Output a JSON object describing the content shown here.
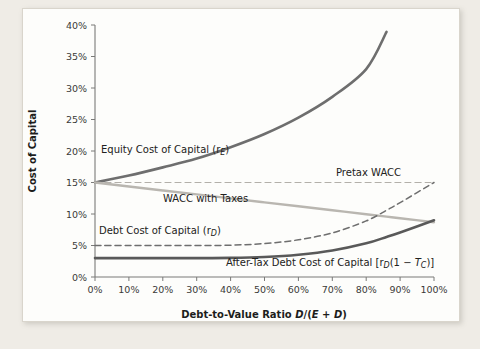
{
  "chart_data": {
    "type": "line",
    "title": "",
    "xlabel": "Debt-to-Value Ratio D/(E + D)",
    "ylabel": "Cost of Capital",
    "xlim": [
      0,
      100
    ],
    "ylim": [
      0,
      40
    ],
    "grid": false,
    "legend_position": "inline-annotations",
    "x_tick_labels": [
      "0%",
      "10%",
      "20%",
      "30%",
      "40%",
      "50%",
      "60%",
      "70%",
      "80%",
      "90%",
      "100%"
    ],
    "x_ticks": [
      0,
      10,
      20,
      30,
      40,
      50,
      60,
      70,
      80,
      90,
      100
    ],
    "y_tick_labels": [
      "0%",
      "5%",
      "10%",
      "15%",
      "20%",
      "25%",
      "30%",
      "35%",
      "40%"
    ],
    "y_ticks": [
      0,
      5,
      10,
      15,
      20,
      25,
      30,
      35,
      40
    ],
    "x": [
      0,
      10,
      20,
      30,
      40,
      50,
      60,
      70,
      80,
      86,
      90,
      100
    ],
    "series": [
      {
        "name": "Equity Cost of Capital (rE)",
        "label": "Equity Cost of Capital (r",
        "label_sub": "E",
        "label_tail": ")",
        "style": "solid",
        "color": "#6e6e6e",
        "width": 2.6,
        "values": [
          15.0,
          16.1,
          17.4,
          18.8,
          20.6,
          22.7,
          25.3,
          28.6,
          33.0,
          38.9,
          null,
          null
        ],
        "x_end": 86,
        "y_end": 38.9
      },
      {
        "name": "Pretax WACC",
        "label": "Pretax WACC",
        "style": "dashed",
        "color": "#b3b0aa",
        "width": 1.2,
        "values": [
          15.0,
          15.0,
          15.0,
          15.0,
          15.0,
          15.0,
          15.0,
          15.0,
          15.0,
          15.0,
          15.0,
          15.0
        ]
      },
      {
        "name": "WACC with Taxes",
        "label": "WACC with Taxes",
        "style": "solid",
        "color": "#b9b6b0",
        "width": 2.4,
        "values": [
          15.0,
          14.37,
          13.74,
          13.11,
          12.48,
          11.85,
          11.22,
          10.59,
          9.96,
          9.58,
          9.33,
          8.7
        ]
      },
      {
        "name": "Debt Cost of Capital (rD)",
        "label": "Debt Cost of Capital (r",
        "label_sub": "D",
        "label_tail": ")",
        "style": "dashed",
        "color": "#6e6e6e",
        "width": 1.5,
        "values": [
          5.0,
          5.0,
          5.0,
          5.0,
          5.05,
          5.3,
          5.9,
          7.0,
          8.9,
          10.6,
          11.8,
          15.0
        ]
      },
      {
        "name": "After-Tax Debt Cost of Capital [rD(1 - Tc)]",
        "label": "After-Tax Debt Cost of Capital [r",
        "label_sub": "D",
        "label_tail_pre": "(1 ",
        "label_minus": "−",
        "label_tail_var": " T",
        "label_sub2": "C",
        "label_tail_end": ")]",
        "style": "solid",
        "color": "#595959",
        "width": 2.6,
        "values": [
          3.0,
          3.0,
          3.0,
          3.0,
          3.03,
          3.18,
          3.54,
          4.2,
          5.34,
          6.36,
          7.08,
          9.0
        ]
      }
    ],
    "annotations": [
      {
        "text": "Equity Cost of Capital (rE)",
        "x": 8,
        "y": 20
      },
      {
        "text": "Pretax WACC",
        "x": 73,
        "y": 16.3
      },
      {
        "text": "WACC with Taxes",
        "x": 25,
        "y": 11.6
      },
      {
        "text": "Debt Cost of Capital (rD)",
        "x": 7,
        "y": 6.6
      },
      {
        "text": "After-Tax Debt Cost of Capital [rD(1 - Tc)]",
        "x": 45,
        "y": 1.6
      }
    ]
  },
  "axes": {
    "y_title": "Cost of Capital",
    "x_title_main": "Debt-to-Value Ratio ",
    "x_title_d": "D",
    "x_title_slash": "/(",
    "x_title_e": "E",
    "x_title_plus": " + ",
    "x_title_d2": "D",
    "x_title_close": ")"
  },
  "colors": {
    "page_background": "#efece6",
    "panel_background": "#fdfdfb",
    "panel_border": "#d9d5cc",
    "axis": "#7a7a78",
    "text": "#1d1d1b",
    "equity_line": "#6e6e6e",
    "pretax_wacc_line": "#b3b0aa",
    "wacc_taxes_line": "#b9b6b0",
    "debt_line": "#6e6e6e",
    "aftertax_debt_line": "#595959"
  }
}
